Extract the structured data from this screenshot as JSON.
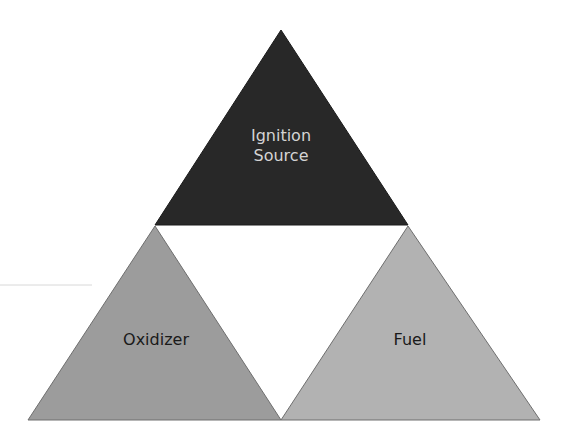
{
  "diagram": {
    "triangles": [
      {
        "id": "ignition",
        "label_lines": [
          "Ignition",
          "Source"
        ],
        "fill": "#282828",
        "text_color": "#d4d4d4",
        "points": "281,30 155,225 408,225"
      },
      {
        "id": "oxidizer",
        "label_lines": [
          "Oxidizer"
        ],
        "fill": "#9c9c9c",
        "text_color": "#1a1a1a",
        "points": "155,226 28,420 281,420"
      },
      {
        "id": "fuel",
        "label_lines": [
          "Fuel"
        ],
        "fill": "#b2b2b2",
        "text_color": "#1a1a1a",
        "points": "408,226 281,420 540,420"
      }
    ],
    "center_gap_fill": "#ffffff",
    "stray_line": {
      "x1": 0,
      "y1": 285,
      "x2": 92,
      "y2": 285,
      "color": "#d8d8d8"
    }
  }
}
